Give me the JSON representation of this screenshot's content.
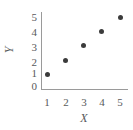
{
  "chart_data": {
    "type": "scatter",
    "title": "",
    "subtitle": "",
    "xlabel": "X",
    "ylabel": "Y",
    "x": [
      1,
      2,
      3,
      4,
      5
    ],
    "values": [
      1,
      2,
      3,
      4,
      5
    ],
    "points": [
      {
        "x": 1,
        "y": 1
      },
      {
        "x": 2,
        "y": 2
      },
      {
        "x": 3,
        "y": 3
      },
      {
        "x": 4,
        "y": 4
      },
      {
        "x": 5,
        "y": 5
      }
    ],
    "xlim": [
      0,
      5.6
    ],
    "ylim": [
      0,
      5.5
    ],
    "x_ticks": [
      "1",
      "2",
      "3",
      "4",
      "5"
    ],
    "y_ticks": [
      "0",
      "1",
      "2",
      "3",
      "4",
      "5"
    ],
    "grid": false,
    "legend": null,
    "annotations": [],
    "marker_color": "#3b3b3b",
    "axis_color": "#9a9a9a",
    "text_color": "#58595b",
    "background_color": "#ffffff"
  }
}
